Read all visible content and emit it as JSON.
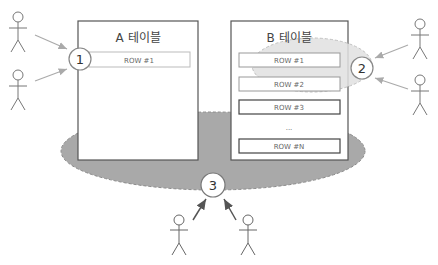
{
  "diagram": {
    "table_a": {
      "title": "A 테이블",
      "rows": [
        "ROW #1"
      ]
    },
    "table_b": {
      "title": "B 테이블",
      "rows": [
        "ROW #1",
        "ROW #2",
        "ROW #3"
      ],
      "ellipsis": "...",
      "last_row": "ROW #N"
    },
    "badges": {
      "one": "1",
      "two": "2",
      "three": "3"
    },
    "actors": {
      "count": 6
    },
    "colors": {
      "table_border": "#555555",
      "row_border_light": "#bbbbbb",
      "row_border_dark": "#444444",
      "shared_ellipse_fill": "#a8a8a8",
      "lock_ellipse_fill": "#dedede",
      "arrow_light": "#aaaaaa",
      "arrow_dark": "#555555"
    }
  }
}
